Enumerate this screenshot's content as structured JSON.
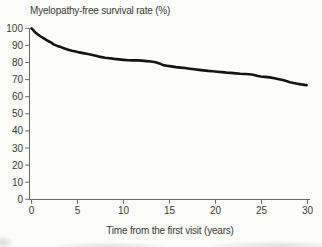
{
  "figure": {
    "background": "#fcfcfa",
    "curve_color": "#141414",
    "axis_color": "#6b6b6b",
    "text_color": "#3a3a3a"
  },
  "chart_data": {
    "type": "line",
    "subtype": "kaplan-meier-survival-curve",
    "title": "Myelopathy-free survival rate (%)",
    "xlabel": "Time from the first visit (years)",
    "ylabel": "Myelopathy-free survival rate (%)",
    "xlim": [
      0,
      30
    ],
    "ylim": [
      0,
      100
    ],
    "x_ticks": [
      0,
      5,
      10,
      15,
      20,
      25,
      30
    ],
    "y_ticks": [
      0,
      10,
      20,
      30,
      40,
      50,
      60,
      70,
      80,
      90,
      100
    ],
    "grid": false,
    "legend_position": "none",
    "series": [
      {
        "name": "Myelopathy-free survival",
        "color": "#141414",
        "points": [
          [
            0,
            100
          ],
          [
            0.15,
            99.2
          ],
          [
            0.4,
            97.6
          ],
          [
            0.7,
            96.4
          ],
          [
            1,
            95.2
          ],
          [
            1.3,
            94.2
          ],
          [
            1.6,
            93.2
          ],
          [
            1.9,
            92.3
          ],
          [
            2.1,
            91.8
          ],
          [
            2.4,
            90.6
          ],
          [
            2.8,
            89.7
          ],
          [
            3.2,
            89
          ],
          [
            3.6,
            88.2
          ],
          [
            4,
            87.5
          ],
          [
            4.4,
            86.9
          ],
          [
            4.8,
            86.4
          ],
          [
            5.2,
            85.9
          ],
          [
            5.6,
            85.5
          ],
          [
            6,
            85.1
          ],
          [
            6.5,
            84.5
          ],
          [
            7,
            83.9
          ],
          [
            7.5,
            83.3
          ],
          [
            8,
            82.8
          ],
          [
            8.5,
            82.5
          ],
          [
            9,
            82.1
          ],
          [
            9.5,
            81.8
          ],
          [
            10,
            81.5
          ],
          [
            10.5,
            81.3
          ],
          [
            11,
            81.2
          ],
          [
            11.5,
            81.2
          ],
          [
            12,
            81.1
          ],
          [
            12.5,
            80.8
          ],
          [
            13,
            80.6
          ],
          [
            13.5,
            80.2
          ],
          [
            13.9,
            79.5
          ],
          [
            14.3,
            78.5
          ],
          [
            14.7,
            78.1
          ],
          [
            15.2,
            77.7
          ],
          [
            15.7,
            77.3
          ],
          [
            16.2,
            77
          ],
          [
            16.7,
            76.8
          ],
          [
            17.2,
            76.4
          ],
          [
            17.7,
            76
          ],
          [
            18.2,
            75.7
          ],
          [
            18.7,
            75.4
          ],
          [
            19.2,
            75.1
          ],
          [
            19.7,
            74.9
          ],
          [
            20.2,
            74.6
          ],
          [
            20.7,
            74.4
          ],
          [
            21.2,
            74.1
          ],
          [
            21.7,
            73.9
          ],
          [
            22.2,
            73.6
          ],
          [
            22.7,
            73.4
          ],
          [
            23.2,
            73.3
          ],
          [
            23.7,
            73.1
          ],
          [
            24.1,
            72.8
          ],
          [
            24.5,
            72.2
          ],
          [
            24.9,
            71.8
          ],
          [
            25.4,
            71.6
          ],
          [
            25.9,
            71.3
          ],
          [
            26.4,
            70.8
          ],
          [
            26.9,
            70.2
          ],
          [
            27.3,
            69.7
          ],
          [
            27.7,
            69.1
          ],
          [
            28.1,
            68.5
          ],
          [
            28.5,
            68
          ],
          [
            28.9,
            67.6
          ],
          [
            29.3,
            67.2
          ],
          [
            29.7,
            66.9
          ],
          [
            29.9,
            66.8
          ]
        ]
      }
    ]
  }
}
